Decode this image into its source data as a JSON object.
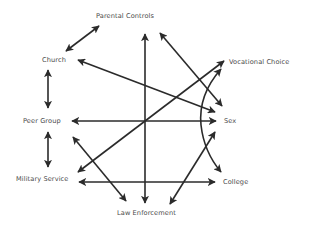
{
  "nodes": {
    "parental_controls": "Parental Controls",
    "church": "Church",
    "vocational_choice": "Vocational Choice",
    "peer_group": "Peer Group",
    "sex": "Sex",
    "military_service": "Military Service",
    "college": "College",
    "law_enforcement": "Law Enforcement"
  },
  "edges": [
    {
      "from": "Parental Controls",
      "to": "Church",
      "arrows": "both"
    },
    {
      "from": "Church",
      "to": "Sex",
      "arrows": "both"
    },
    {
      "from": "Church",
      "to": "Peer Group",
      "arrows": "both"
    },
    {
      "from": "Peer Group",
      "to": "Military Service",
      "arrows": "both"
    },
    {
      "from": "Peer Group",
      "to": "Sex",
      "arrows": "both"
    },
    {
      "from": "Peer Group",
      "to": "Law Enforcement",
      "arrows": "both"
    },
    {
      "from": "Military Service",
      "to": "Vocational Choice",
      "arrows": "both"
    },
    {
      "from": "Military Service",
      "to": "College",
      "arrows": "both"
    },
    {
      "from": "Law Enforcement",
      "to": "Parental Controls",
      "arrows": "both"
    },
    {
      "from": "Law Enforcement",
      "to": "Sex",
      "arrows": "both"
    },
    {
      "from": "Parental Controls",
      "to": "Sex",
      "arrows": "both"
    },
    {
      "from": "Vocational Choice",
      "to": "College",
      "arrows": "both",
      "shape": "arc"
    }
  ],
  "colors": {
    "line": "#2b2b2b",
    "text": "#4a4a4a",
    "background": "#ffffff"
  }
}
